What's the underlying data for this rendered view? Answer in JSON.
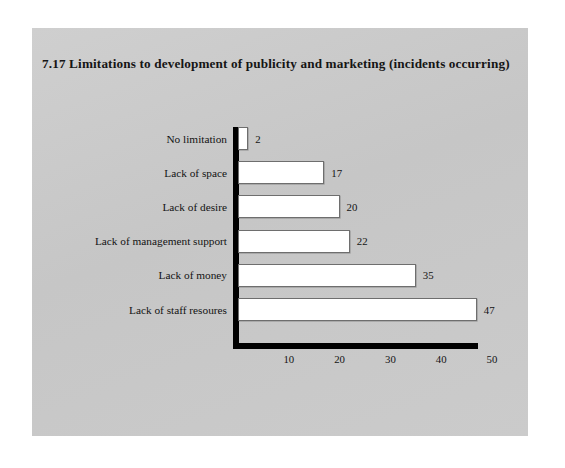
{
  "figure": {
    "number": "7.17",
    "title": "7.17  Limitations to development of publicity and marketing (incidents occurring)",
    "panel_color": "#c9c9c9",
    "bar_fill": "#ffffff",
    "bar_border": "#6e6e6e",
    "axis_color": "#000000",
    "text_color": "#141414"
  },
  "chart_data": {
    "type": "bar",
    "orientation": "horizontal",
    "title": "7.17  Limitations to development of publicity and marketing (incidents occurring)",
    "xlabel": "",
    "ylabel": "",
    "categories": [
      "No limitation",
      "Lack of space",
      "Lack of desire",
      "Lack of management support",
      "Lack of money",
      "Lack of staff resoures"
    ],
    "values": [
      2,
      17,
      20,
      22,
      35,
      47
    ],
    "data_labels": [
      "2",
      "17",
      "20",
      "22",
      "35",
      "47"
    ],
    "xlim": [
      0,
      50
    ],
    "xticks": [
      10,
      20,
      30,
      40,
      50
    ],
    "xtick_labels": [
      "10",
      "20",
      "30",
      "40",
      "50"
    ],
    "grid": false,
    "legend": null
  }
}
